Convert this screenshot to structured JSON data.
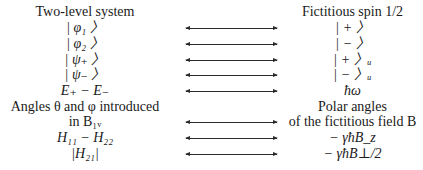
{
  "table": {
    "header": {
      "left": "Two-level system",
      "right": "Fictitious spin 1/2"
    },
    "rows": [
      {
        "left": "| φ₁ 〉",
        "right": "| + 〉",
        "arrow": true
      },
      {
        "left": "| φ₂ 〉",
        "right": "| − 〉",
        "arrow": true
      },
      {
        "left": "| ψ₊ 〉",
        "right": "| + 〉ᵤ",
        "arrow": true
      },
      {
        "left": "| ψ₋ 〉",
        "right": "| − 〉ᵤ",
        "arrow": true
      },
      {
        "left": "E₊ − E₋",
        "right": "ħω",
        "arrow": true
      },
      {
        "left": "Angles θ and φ introduced",
        "right": "Polar angles",
        "arrow": false
      },
      {
        "left": "in B₁ᵥ",
        "right": "of the fictitious field B",
        "arrow": true
      },
      {
        "left": "H₁₁ − H₂₂",
        "right": "− γħB_z",
        "arrow": true
      },
      {
        "left": "|H₂₁|",
        "right": "− γħB⊥/2",
        "arrow": true
      }
    ]
  }
}
